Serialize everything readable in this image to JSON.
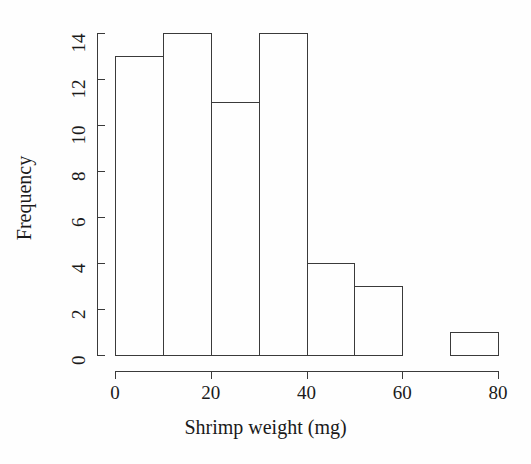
{
  "figure": {
    "background_color": "#fefefe",
    "ink_color": "#3a3a3a",
    "text_color": "#1a1a1a"
  },
  "chart_data": {
    "type": "bar",
    "title": "",
    "subtitle": "",
    "xlabel": "Shrimp weight (mg)",
    "ylabel": "Frequency",
    "xlim": [
      0,
      80
    ],
    "ylim": [
      0,
      14
    ],
    "grid": false,
    "legend": false,
    "legend_position": "none",
    "bin_width": 10,
    "bin_edges": [
      0,
      10,
      20,
      30,
      40,
      50,
      60,
      70,
      80
    ],
    "categories": [
      "0-10",
      "10-20",
      "20-30",
      "30-40",
      "40-50",
      "50-60",
      "60-70",
      "70-80"
    ],
    "values": [
      13,
      14,
      11,
      14,
      4,
      3,
      0,
      1
    ],
    "bars": [
      {
        "label": "0-10",
        "x0": 0,
        "x1": 10,
        "value": 13
      },
      {
        "label": "10-20",
        "x0": 10,
        "x1": 20,
        "value": 14
      },
      {
        "label": "20-30",
        "x0": 20,
        "x1": 30,
        "value": 11
      },
      {
        "label": "30-40",
        "x0": 30,
        "x1": 40,
        "value": 14
      },
      {
        "label": "40-50",
        "x0": 40,
        "x1": 50,
        "value": 4
      },
      {
        "label": "50-60",
        "x0": 50,
        "x1": 60,
        "value": 3
      },
      {
        "label": "60-70",
        "x0": 60,
        "x1": 70,
        "value": 0
      },
      {
        "label": "70-80",
        "x0": 70,
        "x1": 80,
        "value": 1
      }
    ],
    "xticks": [
      0,
      20,
      40,
      60,
      80
    ],
    "xtick_labels": [
      "0",
      "20",
      "40",
      "60",
      "80"
    ],
    "yticks": [
      0,
      2,
      4,
      6,
      8,
      10,
      12,
      14
    ],
    "ytick_labels": [
      "0",
      "2",
      "4",
      "6",
      "8",
      "10",
      "12",
      "14"
    ]
  }
}
